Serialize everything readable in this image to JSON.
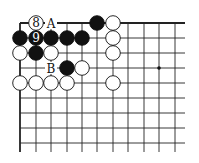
{
  "board": {
    "cols": [
      20,
      36,
      51,
      67,
      82,
      97,
      113,
      128,
      144,
      159,
      175
    ],
    "rows": [
      23,
      38,
      53,
      68,
      83,
      98,
      113,
      128,
      143
    ],
    "line_right": 185,
    "line_bottom": 152,
    "stone_radius": 7.3,
    "star_points": [
      [
        9,
        3
      ]
    ]
  },
  "stones": [
    {
      "c": 1,
      "r": 0,
      "color": "white",
      "label": "8"
    },
    {
      "c": 5,
      "r": 0,
      "color": "black",
      "label": ""
    },
    {
      "c": 6,
      "r": 0,
      "color": "white",
      "label": ""
    },
    {
      "c": 0,
      "r": 1,
      "color": "black",
      "label": ""
    },
    {
      "c": 1,
      "r": 1,
      "color": "black",
      "label": "9"
    },
    {
      "c": 2,
      "r": 1,
      "color": "black",
      "label": ""
    },
    {
      "c": 3,
      "r": 1,
      "color": "black",
      "label": ""
    },
    {
      "c": 4,
      "r": 1,
      "color": "black",
      "label": ""
    },
    {
      "c": 6,
      "r": 1,
      "color": "white",
      "label": ""
    },
    {
      "c": 0,
      "r": 2,
      "color": "white",
      "label": ""
    },
    {
      "c": 1,
      "r": 2,
      "color": "black",
      "label": ""
    },
    {
      "c": 2,
      "r": 2,
      "color": "white",
      "label": ""
    },
    {
      "c": 6,
      "r": 2,
      "color": "white",
      "label": ""
    },
    {
      "c": 3,
      "r": 3,
      "color": "black",
      "label": ""
    },
    {
      "c": 4,
      "r": 3,
      "color": "white",
      "label": ""
    },
    {
      "c": 0,
      "r": 4,
      "color": "white",
      "label": ""
    },
    {
      "c": 1,
      "r": 4,
      "color": "white",
      "label": ""
    },
    {
      "c": 2,
      "r": 4,
      "color": "white",
      "label": ""
    },
    {
      "c": 3,
      "r": 4,
      "color": "white",
      "label": ""
    },
    {
      "c": 6,
      "r": 4,
      "color": "white",
      "label": ""
    }
  ],
  "markers": [
    {
      "c": 2,
      "r": 0,
      "text": "A"
    },
    {
      "c": 2,
      "r": 3,
      "text": "B"
    }
  ]
}
